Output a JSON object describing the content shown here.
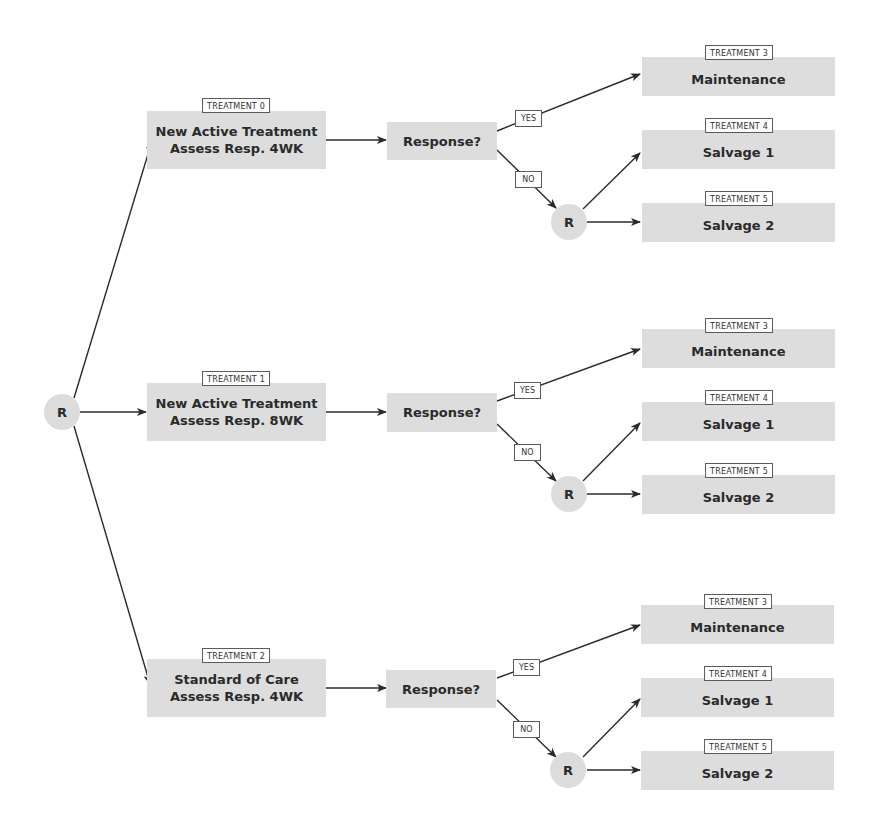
{
  "diagram": {
    "type": "flowchart",
    "root": {
      "label": "R"
    },
    "arms": [
      {
        "tag": "TREATMENT 0",
        "line1": "New Active Treatment",
        "line2": "Assess Resp. 4WK",
        "decision": "Response?",
        "yes_label": "YES",
        "no_label": "NO",
        "rerandomize": "R",
        "outcomes": [
          {
            "tag": "TREATMENT 3",
            "label": "Maintenance"
          },
          {
            "tag": "TREATMENT 4",
            "label": "Salvage 1"
          },
          {
            "tag": "TREATMENT 5",
            "label": "Salvage 2"
          }
        ]
      },
      {
        "tag": "TREATMENT 1",
        "line1": "New Active Treatment",
        "line2": "Assess Resp. 8WK",
        "decision": "Response?",
        "yes_label": "YES",
        "no_label": "NO",
        "rerandomize": "R",
        "outcomes": [
          {
            "tag": "TREATMENT 3",
            "label": "Maintenance"
          },
          {
            "tag": "TREATMENT 4",
            "label": "Salvage 1"
          },
          {
            "tag": "TREATMENT 5",
            "label": "Salvage 2"
          }
        ]
      },
      {
        "tag": "TREATMENT 2",
        "line1": "Standard of Care",
        "line2": "Assess Resp. 4WK",
        "decision": "Response?",
        "yes_label": "YES",
        "no_label": "NO",
        "rerandomize": "R",
        "outcomes": [
          {
            "tag": "TREATMENT 3",
            "label": "Maintenance"
          },
          {
            "tag": "TREATMENT 4",
            "label": "Salvage 1"
          },
          {
            "tag": "TREATMENT 5",
            "label": "Salvage 2"
          }
        ]
      }
    ],
    "colors": {
      "box_fill": "#dddddd",
      "line": "#2a2a2a",
      "text": "#2a2a2a",
      "tag_border": "#5a5a5a"
    }
  }
}
